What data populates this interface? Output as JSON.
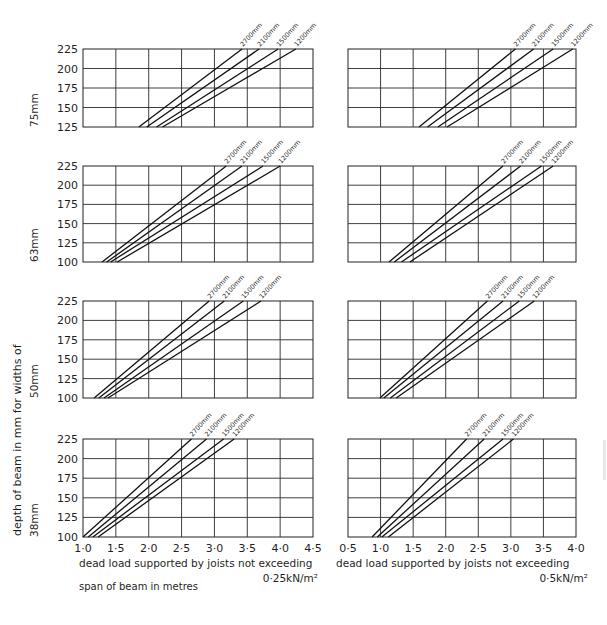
{
  "figure": {
    "y_axis_title": "depth of beam in mm for widths of",
    "x_axis_title": "span of beam in metres",
    "columns": [
      {
        "load_caption_line1": "dead load supported by joists not exceeding",
        "load_caption_line2": "0·25kN/m²",
        "x_ticks": [
          "1·0",
          "1·5",
          "2·0",
          "2·5",
          "3·0",
          "3·5",
          "4·0",
          "4·5"
        ],
        "x_range": [
          1.0,
          4.5
        ]
      },
      {
        "load_caption_line1": "dead load supported by joists not exceeding",
        "load_caption_line2": "0·5kN/m²",
        "x_ticks": [
          "0·5",
          "1·0",
          "1·5",
          "2·0",
          "2·5",
          "3·0",
          "3·5",
          "4·0"
        ],
        "x_range": [
          0.5,
          4.0
        ]
      }
    ],
    "rows": [
      {
        "width_label": "75mm",
        "y_ticks": [
          "225",
          "200",
          "175",
          "150",
          "125"
        ],
        "y_range": [
          125,
          225
        ]
      },
      {
        "width_label": "63mm",
        "y_ticks": [
          "225",
          "200",
          "175",
          "150",
          "125",
          "100"
        ],
        "y_range": [
          100,
          225
        ]
      },
      {
        "width_label": "50mm",
        "y_ticks": [
          "225",
          "200",
          "175",
          "150",
          "125",
          "100"
        ],
        "y_range": [
          100,
          225
        ]
      },
      {
        "width_label": "38mm",
        "y_ticks": [
          "225",
          "200",
          "175",
          "150",
          "125",
          "100"
        ],
        "y_range": [
          100,
          225
        ]
      }
    ],
    "series_labels": [
      "2700mm",
      "2100mm",
      "1500mm",
      "1200mm"
    ]
  },
  "chart_data": [
    {
      "type": "line",
      "title": "75mm width, dead load 0·25kN/m²",
      "xlabel": "span of beam in metres",
      "ylabel": "depth of beam in mm",
      "xlim": [
        1.0,
        4.5
      ],
      "ylim": [
        125,
        225
      ],
      "grid": true,
      "series": [
        {
          "name": "2700mm",
          "x": [
            1.85,
            3.42
          ],
          "y": [
            125,
            225
          ]
        },
        {
          "name": "2100mm",
          "x": [
            1.97,
            3.68
          ],
          "y": [
            125,
            225
          ]
        },
        {
          "name": "1500mm",
          "x": [
            2.12,
            3.97
          ],
          "y": [
            125,
            225
          ]
        },
        {
          "name": "1200mm",
          "x": [
            2.21,
            4.24
          ],
          "y": [
            125,
            225
          ]
        }
      ]
    },
    {
      "type": "line",
      "title": "75mm width, dead load 0·5kN/m²",
      "xlabel": "span of beam in metres",
      "ylabel": "depth of beam in mm",
      "xlim": [
        0.5,
        4.0
      ],
      "ylim": [
        125,
        225
      ],
      "grid": true,
      "series": [
        {
          "name": "2700mm",
          "x": [
            1.59,
            3.07
          ],
          "y": [
            125,
            225
          ]
        },
        {
          "name": "2100mm",
          "x": [
            1.72,
            3.35
          ],
          "y": [
            125,
            225
          ]
        },
        {
          "name": "1500mm",
          "x": [
            1.88,
            3.65
          ],
          "y": [
            125,
            225
          ]
        },
        {
          "name": "1200mm",
          "x": [
            2.02,
            3.95
          ],
          "y": [
            125,
            225
          ]
        }
      ]
    },
    {
      "type": "line",
      "title": "63mm width, dead load 0·25kN/m²",
      "xlabel": "span of beam in metres",
      "ylabel": "depth of beam in mm",
      "xlim": [
        1.0,
        4.5
      ],
      "ylim": [
        100,
        225
      ],
      "grid": true,
      "series": [
        {
          "name": "2700mm",
          "x": [
            1.29,
            3.18
          ],
          "y": [
            100,
            225
          ]
        },
        {
          "name": "2100mm",
          "x": [
            1.36,
            3.42
          ],
          "y": [
            100,
            225
          ]
        },
        {
          "name": "1500mm",
          "x": [
            1.42,
            3.74
          ],
          "y": [
            100,
            225
          ]
        },
        {
          "name": "1200mm",
          "x": [
            1.52,
            4.0
          ],
          "y": [
            100,
            225
          ]
        }
      ]
    },
    {
      "type": "line",
      "title": "63mm width, dead load 0·5kN/m²",
      "xlabel": "span of beam in metres",
      "ylabel": "depth of beam in mm",
      "xlim": [
        0.5,
        4.0
      ],
      "ylim": [
        100,
        225
      ],
      "grid": true,
      "series": [
        {
          "name": "2700mm",
          "x": [
            1.13,
            2.88
          ],
          "y": [
            100,
            225
          ]
        },
        {
          "name": "2100mm",
          "x": [
            1.21,
            3.15
          ],
          "y": [
            100,
            225
          ]
        },
        {
          "name": "1500mm",
          "x": [
            1.32,
            3.47
          ],
          "y": [
            100,
            225
          ]
        },
        {
          "name": "1200mm",
          "x": [
            1.45,
            3.65
          ],
          "y": [
            100,
            225
          ]
        }
      ]
    },
    {
      "type": "line",
      "title": "50mm width, dead load 0·25kN/m²",
      "xlabel": "span of beam in metres",
      "ylabel": "depth of beam in mm",
      "xlim": [
        1.0,
        4.5
      ],
      "ylim": [
        100,
        225
      ],
      "grid": true,
      "series": [
        {
          "name": "2700mm",
          "x": [
            1.17,
            2.92
          ],
          "y": [
            100,
            225
          ]
        },
        {
          "name": "2100mm",
          "x": [
            1.24,
            3.15
          ],
          "y": [
            100,
            225
          ]
        },
        {
          "name": "1500mm",
          "x": [
            1.32,
            3.44
          ],
          "y": [
            100,
            225
          ]
        },
        {
          "name": "1200mm",
          "x": [
            1.38,
            3.71
          ],
          "y": [
            100,
            225
          ]
        }
      ]
    },
    {
      "type": "line",
      "title": "50mm width, dead load 0·5kN/m²",
      "xlabel": "span of beam in metres",
      "ylabel": "depth of beam in mm",
      "xlim": [
        0.5,
        4.0
      ],
      "ylim": [
        100,
        225
      ],
      "grid": true,
      "series": [
        {
          "name": "2700mm",
          "x": [
            0.99,
            2.64
          ],
          "y": [
            100,
            225
          ]
        },
        {
          "name": "2100mm",
          "x": [
            1.05,
            2.88
          ],
          "y": [
            100,
            225
          ]
        },
        {
          "name": "1500mm",
          "x": [
            1.15,
            3.13
          ],
          "y": [
            100,
            225
          ]
        },
        {
          "name": "1200mm",
          "x": [
            1.24,
            3.36
          ],
          "y": [
            100,
            225
          ]
        }
      ]
    },
    {
      "type": "line",
      "title": "38mm width, dead load 0·25kN/m²",
      "xlabel": "span of beam in metres",
      "ylabel": "depth of beam in mm",
      "xlim": [
        1.0,
        4.5
      ],
      "ylim": [
        100,
        225
      ],
      "grid": true,
      "series": [
        {
          "name": "2700mm",
          "x": [
            1.0,
            2.65
          ],
          "y": [
            100,
            225
          ]
        },
        {
          "name": "2100mm",
          "x": [
            1.08,
            2.88
          ],
          "y": [
            100,
            225
          ]
        },
        {
          "name": "1500mm",
          "x": [
            1.15,
            3.14
          ],
          "y": [
            100,
            225
          ]
        },
        {
          "name": "1200mm",
          "x": [
            1.23,
            3.3
          ],
          "y": [
            100,
            225
          ]
        }
      ]
    },
    {
      "type": "line",
      "title": "38mm width, dead load 0·5kN/m²",
      "xlabel": "span of beam in metres",
      "ylabel": "depth of beam in mm",
      "xlim": [
        0.5,
        4.0
      ],
      "ylim": [
        100,
        225
      ],
      "grid": true,
      "series": [
        {
          "name": "2700mm",
          "x": [
            0.87,
            2.32
          ],
          "y": [
            100,
            225
          ]
        },
        {
          "name": "2100mm",
          "x": [
            0.95,
            2.59
          ],
          "y": [
            100,
            225
          ]
        },
        {
          "name": "1500mm",
          "x": [
            1.02,
            2.88
          ],
          "y": [
            100,
            225
          ]
        },
        {
          "name": "1200mm",
          "x": [
            1.12,
            3.04
          ],
          "y": [
            100,
            225
          ]
        }
      ]
    }
  ]
}
